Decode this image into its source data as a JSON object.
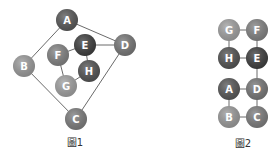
{
  "figures": [
    {
      "caption": "圖1",
      "caption_pos": [
        75,
        146
      ],
      "nodes": [
        {
          "id": "A",
          "x": 67,
          "y": 20,
          "color": "#575757"
        },
        {
          "id": "B",
          "x": 24,
          "y": 66,
          "color": "#9a9a9a"
        },
        {
          "id": "C",
          "x": 76,
          "y": 119,
          "color": "#7c7c7c"
        },
        {
          "id": "D",
          "x": 125,
          "y": 45,
          "color": "#767676"
        },
        {
          "id": "E",
          "x": 85,
          "y": 45,
          "color": "#3d3d3d"
        },
        {
          "id": "F",
          "x": 58,
          "y": 55,
          "color": "#818181"
        },
        {
          "id": "G",
          "x": 66,
          "y": 86,
          "color": "#a0a0a0"
        },
        {
          "id": "H",
          "x": 89,
          "y": 71,
          "color": "#525252"
        }
      ],
      "edges": [
        [
          "A",
          "B"
        ],
        [
          "A",
          "D"
        ],
        [
          "B",
          "C"
        ],
        [
          "C",
          "D"
        ],
        [
          "E",
          "D"
        ],
        [
          "E",
          "F"
        ],
        [
          "E",
          "H"
        ],
        [
          "F",
          "G"
        ],
        [
          "G",
          "H"
        ]
      ]
    },
    {
      "caption": "圖2",
      "caption_pos": [
        243,
        147
      ],
      "nodes": [
        {
          "id": "G",
          "x": 229,
          "y": 30,
          "color": "#a0a0a0"
        },
        {
          "id": "F",
          "x": 257,
          "y": 30,
          "color": "#818181"
        },
        {
          "id": "H",
          "x": 229,
          "y": 58,
          "color": "#525252"
        },
        {
          "id": "E",
          "x": 257,
          "y": 58,
          "color": "#3d3d3d"
        },
        {
          "id": "A",
          "x": 229,
          "y": 89,
          "color": "#575757"
        },
        {
          "id": "D",
          "x": 257,
          "y": 89,
          "color": "#767676"
        },
        {
          "id": "B",
          "x": 229,
          "y": 117,
          "color": "#9a9a9a"
        },
        {
          "id": "C",
          "x": 257,
          "y": 117,
          "color": "#7c7c7c"
        }
      ],
      "edges": [
        [
          "G",
          "F"
        ],
        [
          "G",
          "H"
        ],
        [
          "F",
          "E"
        ],
        [
          "H",
          "E"
        ],
        [
          "E",
          "D"
        ],
        [
          "A",
          "D"
        ],
        [
          "A",
          "B"
        ],
        [
          "D",
          "C"
        ],
        [
          "B",
          "C"
        ]
      ]
    }
  ],
  "node_radius": 11
}
